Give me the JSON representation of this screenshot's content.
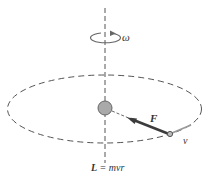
{
  "diagram": {
    "labels": {
      "omega": "ω",
      "force": "F",
      "velocity": "v",
      "angular_momentum_lhs": "L",
      "angular_momentum_eq": " = mvr"
    },
    "colors": {
      "line": "#444444",
      "dash": "#555555",
      "mass_fill": "#a9a9a9",
      "force": "#3c3c3c",
      "velocity": "#9a9a9a"
    }
  }
}
